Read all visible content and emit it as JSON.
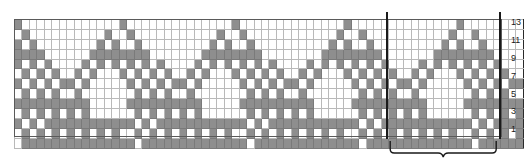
{
  "chart_data": {
    "type": "heatmap",
    "title": "",
    "subtitle": "",
    "xlabel": "",
    "ylabel": "",
    "rows": 13,
    "columns": 68,
    "row_labels": [
      "13",
      "11",
      "9",
      "7",
      "5",
      "3",
      "1"
    ],
    "row_label_rows": [
      13,
      11,
      9,
      7,
      5,
      3,
      1
    ],
    "legend": [
      {
        "key": "on",
        "label": "contrast color (filled)",
        "color": "#8e8e8e"
      },
      {
        "key": "off",
        "label": "main color (empty)",
        "color": "#ffffff"
      }
    ],
    "colors": {
      "filled": "#8e8e8e",
      "empty": "#ffffff",
      "gridline": "#b9b9b9",
      "heavy_line": "#2a2a2a",
      "frame": "#5a5a5a",
      "label": "#1a1a1a"
    },
    "repeat": {
      "stitch_count": 15,
      "start_column": 53,
      "end_column": 68,
      "brace_label": ""
    },
    "heavy_row_separators": [
      11,
      7,
      3
    ],
    "heavy_column_separators": [
      4,
      19,
      34,
      38,
      53,
      68
    ],
    "matrix": [
      [
        1,
        0,
        0,
        0,
        0,
        0,
        0,
        0,
        0,
        0,
        0,
        0,
        0,
        0,
        1,
        0,
        0,
        0,
        0,
        0,
        0,
        0,
        0,
        0,
        0,
        0,
        0,
        0,
        0,
        1,
        0,
        0,
        0,
        0,
        0,
        0,
        0,
        0,
        0,
        0,
        0,
        0,
        0,
        0,
        1,
        0,
        0,
        0,
        0,
        0,
        0,
        0,
        0,
        0,
        0,
        0,
        0,
        0,
        0,
        1,
        0,
        0,
        0,
        0,
        0,
        0,
        0,
        0
      ],
      [
        0,
        1,
        0,
        0,
        0,
        0,
        0,
        0,
        0,
        0,
        0,
        0,
        1,
        0,
        0,
        1,
        0,
        0,
        0,
        0,
        0,
        0,
        0,
        0,
        0,
        0,
        0,
        1,
        0,
        0,
        1,
        0,
        0,
        0,
        0,
        0,
        0,
        0,
        0,
        0,
        0,
        0,
        0,
        1,
        0,
        0,
        1,
        0,
        0,
        0,
        0,
        0,
        0,
        0,
        0,
        0,
        0,
        0,
        1,
        0,
        0,
        1,
        0,
        0,
        0,
        0,
        0,
        0
      ],
      [
        1,
        0,
        1,
        0,
        0,
        0,
        0,
        0,
        0,
        0,
        0,
        1,
        0,
        1,
        0,
        0,
        1,
        0,
        0,
        0,
        0,
        0,
        0,
        0,
        0,
        0,
        1,
        0,
        1,
        0,
        0,
        1,
        0,
        0,
        0,
        0,
        0,
        0,
        0,
        0,
        0,
        0,
        1,
        0,
        1,
        0,
        0,
        1,
        0,
        0,
        0,
        0,
        0,
        0,
        0,
        0,
        0,
        1,
        0,
        1,
        0,
        0,
        1,
        0,
        0,
        0,
        0,
        0
      ],
      [
        1,
        1,
        1,
        1,
        0,
        0,
        0,
        0,
        0,
        0,
        1,
        1,
        1,
        1,
        1,
        1,
        1,
        1,
        0,
        0,
        0,
        0,
        0,
        0,
        0,
        1,
        1,
        1,
        1,
        1,
        1,
        1,
        1,
        0,
        0,
        0,
        0,
        0,
        0,
        0,
        0,
        1,
        1,
        1,
        1,
        1,
        1,
        1,
        1,
        0,
        0,
        0,
        0,
        0,
        0,
        0,
        1,
        1,
        1,
        1,
        1,
        1,
        1,
        1,
        0,
        0,
        0,
        0
      ],
      [
        1,
        0,
        1,
        0,
        1,
        0,
        0,
        0,
        0,
        1,
        0,
        1,
        0,
        1,
        0,
        1,
        0,
        1,
        0,
        1,
        0,
        0,
        0,
        0,
        1,
        0,
        1,
        0,
        1,
        0,
        1,
        0,
        1,
        0,
        1,
        0,
        0,
        0,
        0,
        1,
        0,
        1,
        0,
        1,
        0,
        1,
        0,
        1,
        0,
        1,
        0,
        0,
        0,
        0,
        1,
        0,
        1,
        0,
        1,
        0,
        1,
        0,
        1,
        0,
        1,
        0,
        0,
        0
      ],
      [
        0,
        1,
        0,
        1,
        0,
        1,
        0,
        0,
        1,
        0,
        1,
        0,
        0,
        0,
        1,
        0,
        1,
        0,
        1,
        0,
        1,
        0,
        0,
        1,
        0,
        1,
        0,
        0,
        0,
        1,
        0,
        1,
        0,
        1,
        0,
        1,
        0,
        0,
        1,
        0,
        1,
        0,
        0,
        0,
        1,
        0,
        1,
        0,
        1,
        0,
        1,
        0,
        0,
        1,
        0,
        1,
        0,
        0,
        0,
        1,
        0,
        1,
        0,
        1,
        0,
        1,
        0,
        0
      ],
      [
        1,
        0,
        1,
        0,
        1,
        0,
        1,
        1,
        0,
        1,
        0,
        0,
        0,
        0,
        0,
        1,
        0,
        1,
        0,
        1,
        0,
        1,
        1,
        0,
        1,
        0,
        0,
        0,
        0,
        0,
        1,
        0,
        1,
        0,
        1,
        0,
        1,
        1,
        0,
        1,
        0,
        0,
        0,
        0,
        0,
        1,
        0,
        1,
        0,
        1,
        0,
        1,
        1,
        0,
        1,
        0,
        0,
        0,
        0,
        0,
        1,
        0,
        1,
        0,
        1,
        0,
        1,
        1
      ],
      [
        0,
        1,
        0,
        1,
        0,
        1,
        0,
        0,
        1,
        0,
        0,
        0,
        0,
        0,
        0,
        0,
        1,
        0,
        1,
        0,
        1,
        0,
        0,
        1,
        0,
        0,
        0,
        0,
        0,
        0,
        0,
        1,
        0,
        1,
        0,
        1,
        0,
        0,
        1,
        0,
        0,
        0,
        0,
        0,
        0,
        0,
        1,
        0,
        1,
        0,
        1,
        0,
        0,
        1,
        0,
        0,
        0,
        0,
        0,
        0,
        0,
        1,
        0,
        1,
        0,
        1,
        0,
        0
      ],
      [
        1,
        1,
        1,
        1,
        1,
        1,
        1,
        1,
        1,
        1,
        0,
        0,
        0,
        0,
        0,
        1,
        1,
        1,
        1,
        1,
        1,
        1,
        1,
        1,
        1,
        0,
        0,
        0,
        0,
        0,
        1,
        1,
        1,
        1,
        1,
        1,
        1,
        1,
        1,
        1,
        0,
        0,
        0,
        0,
        0,
        1,
        1,
        1,
        1,
        1,
        1,
        1,
        1,
        1,
        1,
        0,
        0,
        0,
        0,
        0,
        1,
        1,
        1,
        1,
        1,
        1,
        1,
        1
      ],
      [
        0,
        1,
        0,
        1,
        0,
        1,
        0,
        1,
        0,
        1,
        0,
        0,
        0,
        0,
        0,
        0,
        1,
        0,
        1,
        0,
        1,
        0,
        1,
        0,
        1,
        0,
        0,
        0,
        0,
        0,
        0,
        1,
        0,
        1,
        0,
        1,
        0,
        1,
        0,
        1,
        0,
        0,
        0,
        0,
        0,
        0,
        1,
        0,
        1,
        0,
        1,
        0,
        1,
        0,
        1,
        0,
        0,
        0,
        0,
        0,
        0,
        1,
        0,
        1,
        0,
        1,
        0,
        1
      ],
      [
        1,
        0,
        1,
        0,
        1,
        1,
        1,
        1,
        1,
        1,
        1,
        1,
        1,
        1,
        1,
        1,
        0,
        1,
        0,
        1,
        1,
        1,
        1,
        1,
        1,
        1,
        1,
        1,
        1,
        1,
        1,
        0,
        1,
        0,
        1,
        1,
        1,
        1,
        1,
        1,
        1,
        1,
        1,
        1,
        1,
        1,
        0,
        1,
        0,
        1,
        1,
        1,
        1,
        1,
        1,
        1,
        1,
        1,
        1,
        1,
        1,
        0,
        1,
        0,
        1,
        1,
        1,
        1
      ],
      [
        0,
        1,
        0,
        1,
        0,
        1,
        0,
        1,
        0,
        1,
        0,
        1,
        0,
        1,
        0,
        0,
        1,
        0,
        1,
        0,
        1,
        0,
        1,
        0,
        1,
        0,
        1,
        0,
        1,
        0,
        0,
        1,
        0,
        1,
        0,
        1,
        0,
        1,
        0,
        1,
        0,
        1,
        0,
        1,
        0,
        0,
        1,
        0,
        1,
        0,
        1,
        0,
        1,
        0,
        1,
        0,
        1,
        0,
        1,
        0,
        0,
        1,
        0,
        1,
        0,
        1,
        0,
        1
      ],
      [
        0,
        1,
        1,
        1,
        1,
        1,
        1,
        1,
        1,
        1,
        1,
        1,
        1,
        1,
        1,
        1,
        0,
        1,
        1,
        1,
        1,
        1,
        1,
        1,
        1,
        1,
        1,
        1,
        1,
        1,
        1,
        0,
        1,
        1,
        1,
        1,
        1,
        1,
        1,
        1,
        1,
        1,
        1,
        1,
        1,
        1,
        0,
        1,
        1,
        1,
        1,
        1,
        1,
        1,
        1,
        1,
        1,
        1,
        1,
        1,
        1,
        0,
        1,
        1,
        1,
        1,
        1,
        1
      ]
    ]
  }
}
